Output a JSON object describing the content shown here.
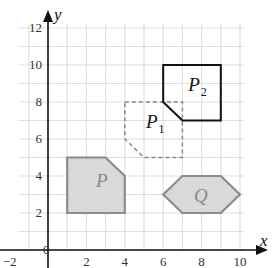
{
  "axes": {
    "x_label": "x",
    "y_label": "y",
    "origin_label": "0",
    "x_ticks": [
      {
        "value": -2,
        "label": "−2"
      },
      {
        "value": 2,
        "label": "2"
      },
      {
        "value": 4,
        "label": "4"
      },
      {
        "value": 6,
        "label": "6"
      },
      {
        "value": 8,
        "label": "8"
      },
      {
        "value": 10,
        "label": "10"
      }
    ],
    "y_ticks": [
      {
        "value": 2,
        "label": "2"
      },
      {
        "value": 4,
        "label": "4"
      },
      {
        "value": 6,
        "label": "6"
      },
      {
        "value": 8,
        "label": "8"
      },
      {
        "value": 10,
        "label": "10"
      },
      {
        "value": 12,
        "label": "12"
      }
    ],
    "grid": {
      "x_min": -1,
      "x_max": 10,
      "y_min": 0,
      "y_max": 12,
      "step": 1
    }
  },
  "shapes": [
    {
      "id": "P",
      "label": "P",
      "subscript": "",
      "style": "filled-gray",
      "stroke": "#8c8c8c",
      "fill": "#d9d9d9",
      "vertices": [
        [
          1,
          2
        ],
        [
          4,
          2
        ],
        [
          4,
          4
        ],
        [
          3,
          5
        ],
        [
          1,
          5
        ]
      ],
      "label_pos": [
        2.5,
        3.4
      ]
    },
    {
      "id": "P1",
      "label": "P",
      "subscript": "1",
      "style": "dashed",
      "stroke": "#888888",
      "fill": "none",
      "vertices": [
        [
          4,
          8
        ],
        [
          7,
          8
        ],
        [
          7,
          5
        ],
        [
          5,
          5
        ],
        [
          4,
          6
        ]
      ],
      "label_pos": [
        5.1,
        6.6
      ]
    },
    {
      "id": "P2",
      "label": "P",
      "subscript": "2",
      "style": "solid-black",
      "stroke": "#111111",
      "fill": "none",
      "vertices": [
        [
          6,
          10
        ],
        [
          9,
          10
        ],
        [
          9,
          7
        ],
        [
          7,
          7
        ],
        [
          6,
          8
        ]
      ],
      "label_pos": [
        7.3,
        8.6
      ]
    },
    {
      "id": "Q",
      "label": "Q",
      "subscript": "",
      "style": "filled-gray",
      "stroke": "#8c8c8c",
      "fill": "#d9d9d9",
      "vertices": [
        [
          6,
          3
        ],
        [
          7,
          4
        ],
        [
          9,
          4
        ],
        [
          10,
          3
        ],
        [
          9,
          2
        ],
        [
          7,
          2
        ]
      ],
      "label_pos": [
        7.6,
        2.6
      ]
    }
  ],
  "colors": {
    "grid": "#d4d4d4",
    "axis": "#111111"
  }
}
